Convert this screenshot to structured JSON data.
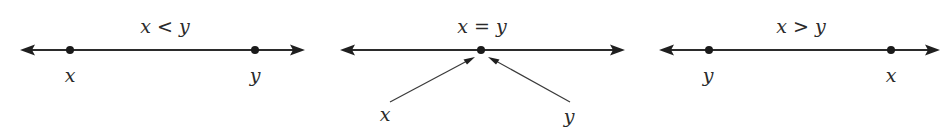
{
  "diagrams": [
    {
      "relation": "x < y",
      "line": {
        "x1": 20,
        "x2": 305,
        "y": 50
      },
      "points": [
        {
          "label": "x",
          "cx": 70,
          "label_x": 70,
          "label_y": 82
        },
        {
          "label": "y",
          "cx": 255,
          "label_x": 255,
          "label_y": 82
        }
      ],
      "title_x": 165,
      "title_y": 33
    },
    {
      "relation": "x = y",
      "line": {
        "x1": 340,
        "x2": 625,
        "y": 50
      },
      "points": [
        {
          "label": "",
          "cx": 481
        }
      ],
      "pointers": [
        {
          "label": "x",
          "from": [
            390,
            102
          ],
          "to": [
            474,
            57
          ],
          "label_x": 385,
          "label_y": 121
        },
        {
          "label": "y",
          "from": [
            570,
            102
          ],
          "to": [
            489,
            57
          ],
          "label_x": 569,
          "label_y": 123
        }
      ],
      "title_x": 482,
      "title_y": 33
    },
    {
      "relation": "x > y",
      "line": {
        "x1": 660,
        "x2": 940,
        "y": 50
      },
      "points": [
        {
          "label": "y",
          "cx": 709,
          "label_x": 708,
          "label_y": 82
        },
        {
          "label": "x",
          "cx": 891,
          "label_x": 891,
          "label_y": 82
        }
      ],
      "title_x": 801,
      "title_y": 33
    }
  ],
  "colors": {
    "ink": "#222222",
    "background": "#ffffff"
  }
}
